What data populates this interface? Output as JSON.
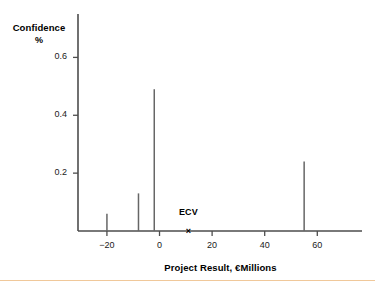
{
  "chart_data": {
    "type": "bar",
    "title": "",
    "subtitle": "",
    "xlabel": "Project Result, €Millions",
    "ylabel": "Confidence",
    "ylabel_unit": "%",
    "x": [
      -20,
      -8,
      -2,
      55
    ],
    "values": [
      0.06,
      0.13,
      0.49,
      0.24
    ],
    "series": [
      {
        "name": "Confidence",
        "x": [
          -20,
          -8,
          -2,
          55
        ],
        "values": [
          0.06,
          0.13,
          0.49,
          0.24
        ]
      }
    ],
    "xlim": [
      -31,
      77
    ],
    "ylim": [
      0,
      0.75
    ],
    "xticks": [
      -20,
      0,
      20,
      40,
      60
    ],
    "xtick_labels": [
      "−20",
      "0",
      "20",
      "40",
      "60"
    ],
    "yticks": [
      0.2,
      0.4,
      0.6
    ],
    "ytick_labels": [
      "0.2",
      "0.4",
      "0.6"
    ],
    "grid": false,
    "legend": false,
    "legend_position": "none",
    "annotations": [
      {
        "name": "ecv-marker",
        "label": "ECV",
        "marker": "×",
        "x": 11,
        "y": 0
      }
    ],
    "colors": {
      "axis": "#4d4d4d",
      "spike": "#666666",
      "text": "#000000",
      "background": "#ffffff",
      "bottom_rule": "#f0c89a"
    }
  }
}
